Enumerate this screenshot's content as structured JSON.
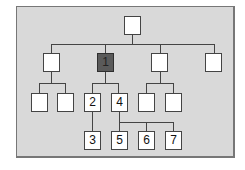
{
  "diagram": {
    "type": "hierarchy-tree",
    "colors": {
      "panel": "#d9d9d9",
      "box": "#ffffff",
      "highlight": "#5a5a5a",
      "line": "#444444"
    },
    "nodes": {
      "root": "",
      "l1_a": "",
      "l1_b": "1",
      "l1_c": "",
      "l1_d": "",
      "l2_a1": "",
      "l2_a2": "",
      "l2_b1": "2",
      "l2_b2": "4",
      "l2_c1": "",
      "l2_c2": "",
      "l3_b1": "3",
      "l3_b2a": "5",
      "l3_b2b": "6",
      "l3_b2c": "7"
    }
  }
}
